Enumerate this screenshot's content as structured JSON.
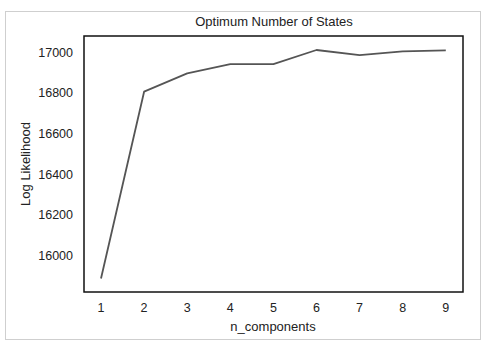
{
  "chart_data": {
    "type": "line",
    "title": "Optimum Number of States",
    "xlabel": "n_components",
    "ylabel": "Log Likelihood",
    "x": [
      1,
      2,
      3,
      4,
      5,
      6,
      7,
      8,
      9
    ],
    "series": [
      {
        "name": "Log Likelihood",
        "values": [
          15887,
          16805,
          16895,
          16940,
          16940,
          17010,
          16985,
          17003,
          17008
        ],
        "color": "#555555"
      }
    ],
    "xticks": [
      "1",
      "2",
      "3",
      "4",
      "5",
      "6",
      "7",
      "8",
      "9"
    ],
    "yticks": [
      "16000",
      "16200",
      "16400",
      "16600",
      "16800",
      "17000"
    ],
    "xlim": [
      0.6,
      9.4
    ],
    "ylim": [
      15830,
      17060
    ],
    "grid": false,
    "legend": null
  },
  "colors": {
    "line": "#555555",
    "axes": "#111111",
    "frame": "#cfcfcf",
    "background": "#ffffff"
  }
}
